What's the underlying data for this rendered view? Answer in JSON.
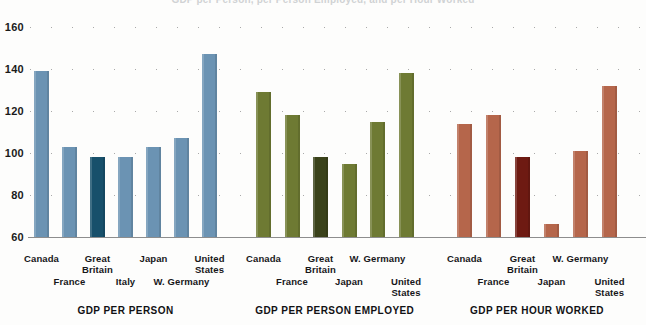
{
  "title_clipped": "GDP per Person, per Person Employed, and per Hour Worked",
  "chart_data": {
    "type": "bar",
    "title": "GDP per Person, per Person Employed, and per Hour Worked",
    "xlabel": "",
    "ylabel": "",
    "ylim": [
      60,
      168
    ],
    "yticks": [
      60,
      80,
      100,
      120,
      140,
      160
    ],
    "ytick_labels": [
      "60",
      "80",
      "100",
      "120",
      "140",
      "160"
    ],
    "grid": "dotted-horizontal",
    "legend": "none",
    "note": "Great Britain = 100 index baseline, shown as darker bar in each panel",
    "panels": [
      {
        "title": "GDP PER PERSON",
        "color": "#6b93b3",
        "highlight_color": "#17506b",
        "categories": [
          "Canada",
          "France",
          "Great Britain",
          "Italy",
          "Japan",
          "W. Germany",
          "United States"
        ],
        "values": [
          139,
          103,
          98,
          98,
          103,
          107,
          147
        ],
        "highlight_index": 2
      },
      {
        "title": "GDP PER PERSON EMPLOYED",
        "color": "#6e7a33",
        "highlight_color": "#3a421a",
        "categories": [
          "Canada",
          "France",
          "Great Britain",
          "Japan",
          "W. Germany",
          "United States"
        ],
        "values": [
          129,
          118,
          98,
          95,
          115,
          138
        ],
        "highlight_index": 2
      },
      {
        "title": "GDP PER HOUR WORKED",
        "color": "#b5664b",
        "highlight_color": "#6e1a12",
        "categories": [
          "Canada",
          "France",
          "Great Britain",
          "Japan",
          "W. Germany",
          "United States"
        ],
        "values": [
          114,
          118,
          98,
          66,
          101,
          132
        ],
        "highlight_index": 2
      }
    ]
  }
}
